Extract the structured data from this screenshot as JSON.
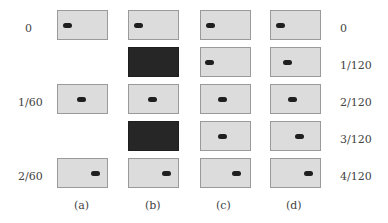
{
  "figure": {
    "left_labels": [
      "0",
      "",
      "1/60",
      "",
      "2/60"
    ],
    "right_labels": [
      "0",
      "1/120",
      "2/120",
      "3/120",
      "4/120"
    ],
    "column_labels": [
      "(a)",
      "(b)",
      "(c)",
      "(d)"
    ],
    "columns": [
      {
        "name": "a",
        "x": 57,
        "frames": [
          {
            "type": "frame",
            "dot_x": 5
          },
          {
            "type": "empty"
          },
          {
            "type": "frame",
            "dot_x": 19
          },
          {
            "type": "empty"
          },
          {
            "type": "frame",
            "dot_x": 33
          }
        ]
      },
      {
        "name": "b",
        "x": 128,
        "frames": [
          {
            "type": "frame",
            "dot_x": 5
          },
          {
            "type": "dark"
          },
          {
            "type": "frame",
            "dot_x": 19
          },
          {
            "type": "dark"
          },
          {
            "type": "frame",
            "dot_x": 33
          }
        ]
      },
      {
        "name": "c",
        "x": 200,
        "frames": [
          {
            "type": "frame",
            "dot_x": 5
          },
          {
            "type": "frame",
            "dot_x": 4
          },
          {
            "type": "frame",
            "dot_x": 17
          },
          {
            "type": "frame",
            "dot_x": 17
          },
          {
            "type": "frame",
            "dot_x": 31
          }
        ]
      },
      {
        "name": "d",
        "x": 270,
        "frames": [
          {
            "type": "frame",
            "dot_x": 5
          },
          {
            "type": "frame",
            "dot_x": 12
          },
          {
            "type": "frame",
            "dot_x": 17
          },
          {
            "type": "frame",
            "dot_x": 24
          },
          {
            "type": "frame",
            "dot_x": 33
          }
        ]
      }
    ],
    "row_tops": [
      10,
      47,
      84,
      121,
      158
    ],
    "colors": {
      "frame_bg": "#dcdcdc",
      "dark_frame": "#262626",
      "dot": "#1f1f1f"
    }
  }
}
